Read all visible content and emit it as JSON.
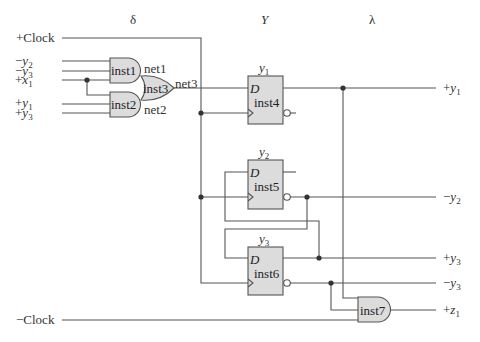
{
  "section_headers": {
    "delta": "δ",
    "Y": "Y",
    "lambda": "λ"
  },
  "clock_inputs": {
    "plus_clock": "+Clock",
    "minus_clock": "−Clock"
  },
  "inputs": [
    {
      "sign": "−",
      "var": "y",
      "sub": "2"
    },
    {
      "sign": "−",
      "var": "y",
      "sub": "3"
    },
    {
      "sign": "+",
      "var": "x",
      "sub": "1"
    },
    {
      "sign": "+",
      "var": "y",
      "sub": "1"
    },
    {
      "sign": "+",
      "var": "y",
      "sub": "3"
    }
  ],
  "gates": {
    "inst1": {
      "label": "inst1",
      "type": "AND"
    },
    "inst2": {
      "label": "inst2",
      "type": "AND"
    },
    "inst3": {
      "label": "inst3",
      "type": "OR"
    },
    "inst7": {
      "label": "inst7",
      "type": "AND"
    }
  },
  "nets": {
    "net1": "net1",
    "net2": "net2",
    "net3": "net3"
  },
  "flipflops": [
    {
      "label": "inst4",
      "d": "D",
      "state_var": "y",
      "state_sub": "1"
    },
    {
      "label": "inst5",
      "d": "D",
      "state_var": "y",
      "state_sub": "2"
    },
    {
      "label": "inst6",
      "d": "D",
      "state_var": "y",
      "state_sub": "3"
    }
  ],
  "outputs": [
    {
      "sign": "+",
      "var": "y",
      "sub": "1"
    },
    {
      "sign": "−",
      "var": "y",
      "sub": "2"
    },
    {
      "sign": "+",
      "var": "y",
      "sub": "3"
    },
    {
      "sign": "−",
      "var": "y",
      "sub": "3"
    },
    {
      "sign": "+",
      "var": "z",
      "sub": "1"
    }
  ]
}
